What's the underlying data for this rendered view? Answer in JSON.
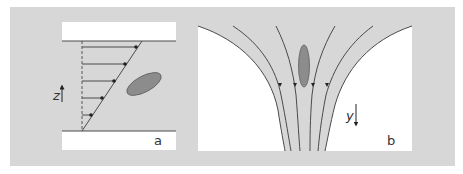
{
  "figure": {
    "colors": {
      "background": "#d7d7d7",
      "plate": "#ffffff",
      "line": "#4a4a4a",
      "particle_fill": "#8c8c8c",
      "particle_stroke": "#5e5e5e"
    },
    "panel_a": {
      "label": "a",
      "axis_label": "z",
      "axis_direction": "up",
      "description": "Simple shear flow between two plates with a tilted elliptical particle",
      "velocity_arrows_count": 5
    },
    "panel_b": {
      "label": "b",
      "axis_label": "y",
      "axis_direction": "down",
      "description": "Converging extensional flow with streamlines and an elongated vertical particle",
      "streamlines_count": 6
    }
  }
}
